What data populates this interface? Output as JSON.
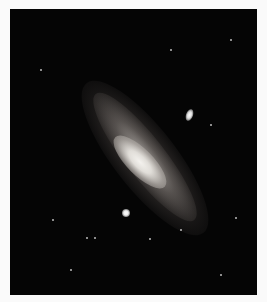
{
  "image": {
    "subject": "Spiral galaxy with bright core and two satellite galaxies on a starfield",
    "background_color": "#050505",
    "border_color": "#fafafa"
  }
}
